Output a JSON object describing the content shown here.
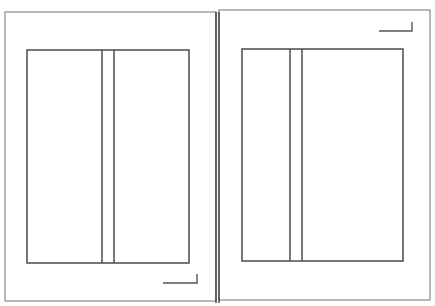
{
  "diagram": {
    "type": "book-spread-layout",
    "canvas": {
      "width": 435,
      "height": 306,
      "background": "#ffffff"
    },
    "colors": {
      "page_border": "#8a8a8a",
      "frame": "#4a4a4a",
      "spine": "#3c3c3c",
      "corner_mark": "#555555"
    },
    "spine": {
      "x1": 216,
      "x2": 219,
      "y_top": 12,
      "y_bottom": 303
    },
    "pages": [
      {
        "id": "left-page",
        "border": {
          "x": 5,
          "y": 12,
          "w": 211,
          "h": 289
        },
        "inner_frame": {
          "x": 27,
          "y": 50,
          "w": 162,
          "h": 213
        },
        "column_lines_x": [
          102,
          114
        ],
        "corner_mark": {
          "x1": 163,
          "x2": 197,
          "y": 283,
          "y_top": 274,
          "position": "bottom-right"
        }
      },
      {
        "id": "right-page",
        "border": {
          "x": 219,
          "y": 10,
          "w": 211,
          "h": 290
        },
        "inner_frame": {
          "x": 242,
          "y": 49,
          "w": 161,
          "h": 212
        },
        "column_lines_x": [
          290,
          302
        ],
        "corner_mark": {
          "x1": 379,
          "x2": 412,
          "y": 31,
          "y_top": 22,
          "position": "top-right"
        }
      }
    ]
  }
}
